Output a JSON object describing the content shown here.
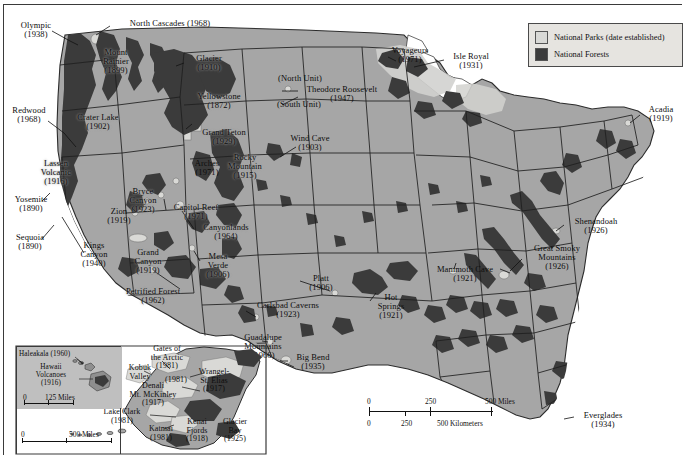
{
  "map": {
    "title": "United States National Parks and National Forests",
    "colors": {
      "land": "#a6a6a6",
      "park": "#d9d9d6",
      "forest": "#3b3b3b",
      "water": "#ffffff",
      "border": "#2b2b2b",
      "legend_bg": "#e6e4e0",
      "text": "#0d0d0d"
    }
  },
  "legend": {
    "items": [
      {
        "label": "National Parks (date established)",
        "swatch": "#d9d9d6",
        "name": "legend-national-parks"
      },
      {
        "label": "National Forests",
        "swatch": "#3b3b3b",
        "name": "legend-national-forests"
      }
    ]
  },
  "scale_main": {
    "miles_ticks": [
      "0",
      "250",
      "500 Miles"
    ],
    "km_ticks": [
      "0",
      "250",
      "500 Kilometers"
    ]
  },
  "scale_hawaii": {
    "ticks": [
      "0",
      "125 Miles"
    ]
  },
  "scale_alaska": {
    "ticks": [
      "0",
      "500 Miles"
    ]
  },
  "parks": [
    {
      "name": "olympic",
      "label": "Olympic\n(1938)",
      "x": 6,
      "y": 16,
      "w": 52
    },
    {
      "name": "north-cascades",
      "label": "North Cascades (1968)",
      "x": 108,
      "y": 14,
      "w": 116
    },
    {
      "name": "mount-rainier",
      "label": "Mount\nRainier\n(1899)",
      "x": 89,
      "y": 43,
      "w": 46
    },
    {
      "name": "glacier",
      "label": "Glacier\n(1910)",
      "x": 183,
      "y": 49,
      "w": 44
    },
    {
      "name": "yellowstone",
      "label": "Yellowstone\n(1872)",
      "x": 185,
      "y": 87,
      "w": 60
    },
    {
      "name": "grand-teton",
      "label": "Grand Teton\n(1929)",
      "x": 189,
      "y": 123,
      "w": 62
    },
    {
      "name": "north-unit",
      "label": "(North Unit)",
      "x": 268,
      "y": 69,
      "w": 56
    },
    {
      "name": "theodore-roosevelt",
      "label": "Theodore Roosevelt\n(1947)",
      "x": 294,
      "y": 80,
      "w": 88
    },
    {
      "name": "south-unit",
      "label": "(South Unit)",
      "x": 266,
      "y": 95,
      "w": 58
    },
    {
      "name": "voyageurs",
      "label": "Voyageurs\n(1971)",
      "x": 380,
      "y": 41,
      "w": 52
    },
    {
      "name": "isle-royal",
      "label": "Isle Royal\n(1931)",
      "x": 443,
      "y": 47,
      "w": 48
    },
    {
      "name": "acadia",
      "label": "Acadia\n(1919)",
      "x": 637,
      "y": 100,
      "w": 40
    },
    {
      "name": "redwood",
      "label": "Redwood\n(1968)",
      "x": 2,
      "y": 101,
      "w": 46
    },
    {
      "name": "crater-lake",
      "label": "Crater Lake\n(1902)",
      "x": 66,
      "y": 108,
      "w": 56
    },
    {
      "name": "wind-cave",
      "label": "Wind Cave\n(1903)",
      "x": 281,
      "y": 129,
      "w": 50
    },
    {
      "name": "lassen-volcanic",
      "label": "Lassen\nVolcanic\n(1916)",
      "x": 30,
      "y": 154,
      "w": 44
    },
    {
      "name": "arches",
      "label": "Arches\n(1971)",
      "x": 183,
      "y": 154,
      "w": 40
    },
    {
      "name": "rocky-mountain",
      "label": "Rocky\nMountain\n(1915)",
      "x": 218,
      "y": 148,
      "w": 46
    },
    {
      "name": "yosemite",
      "label": "Yosemite\n(1890)",
      "x": 5,
      "y": 190,
      "w": 44
    },
    {
      "name": "bryce-canyon",
      "label": "Bryce\nCanyon\n(1923)",
      "x": 119,
      "y": 182,
      "w": 40
    },
    {
      "name": "zion",
      "label": "Zion\n(1919)",
      "x": 98,
      "y": 202,
      "w": 34
    },
    {
      "name": "capitol-reef",
      "label": "Capitol Reef\n(1971)",
      "x": 163,
      "y": 198,
      "w": 58
    },
    {
      "name": "canyonlands",
      "label": "Canyonlands\n(1964)",
      "x": 191,
      "y": 218,
      "w": 62
    },
    {
      "name": "sequoia",
      "label": "Sequoia\n(1890)",
      "x": 4,
      "y": 228,
      "w": 44
    },
    {
      "name": "kings-canyon",
      "label": "Kings\nCanyon\n(1940)",
      "x": 69,
      "y": 236,
      "w": 42
    },
    {
      "name": "grand-canyon",
      "label": "Grand\nCanyon\n(1919)",
      "x": 122,
      "y": 243,
      "w": 44
    },
    {
      "name": "mesa-verde",
      "label": "Mesa\nVerde\n(1906)",
      "x": 194,
      "y": 247,
      "w": 40
    },
    {
      "name": "shenandoah",
      "label": "Shenandoah\n(1926)",
      "x": 563,
      "y": 212,
      "w": 58
    },
    {
      "name": "great-smoky",
      "label": "Great Smoky\nMountains\n(1926)",
      "x": 522,
      "y": 239,
      "w": 62
    },
    {
      "name": "mammoth-cave",
      "label": "Mammoth Cave\n(1921)",
      "x": 424,
      "y": 260,
      "w": 74
    },
    {
      "name": "petrified-forest",
      "label": "Petrified Forest\n(1962)",
      "x": 112,
      "y": 282,
      "w": 74
    },
    {
      "name": "platt",
      "label": "Platt\n(1906)",
      "x": 300,
      "y": 269,
      "w": 34
    },
    {
      "name": "hot-springs",
      "label": "Hot\nSprings\n(1921)",
      "x": 367,
      "y": 288,
      "w": 40
    },
    {
      "name": "carlsbad-caverns",
      "label": "Carlsbad Caverns\n(1923)",
      "x": 243,
      "y": 296,
      "w": 82
    },
    {
      "name": "guadalupe-mountains",
      "label": "Guadalupe\nMountains\n(1966)",
      "x": 231,
      "y": 328,
      "w": 56
    },
    {
      "name": "big-bend",
      "label": "Big Bend\n(1935)",
      "x": 285,
      "y": 348,
      "w": 48
    },
    {
      "name": "everglades",
      "label": "Everglades\n(1934)",
      "x": 572,
      "y": 406,
      "w": 54
    }
  ],
  "alaska_parks": [
    {
      "name": "gates-of-the-arctic",
      "label": "Gates of\nthe Arctic\n(1981)",
      "x": 140,
      "y": 340,
      "w": 46
    },
    {
      "name": "kobuk-valley",
      "label": "Kobuk\nValley",
      "x": 118,
      "y": 359,
      "w": 36
    },
    {
      "name": "kobuk-valley-date",
      "label": "(1981)",
      "x": 156,
      "y": 371,
      "w": 32
    },
    {
      "name": "wrangell-st-elias",
      "label": "Wrangel-\nSt. Elias\n(1917)",
      "x": 188,
      "y": 363,
      "w": 44
    },
    {
      "name": "denali",
      "label": "Denali\nMt. McKinley\n(1917)",
      "x": 116,
      "y": 377,
      "w": 66
    },
    {
      "name": "lake-clark",
      "label": "Lake Clark\n(1981)",
      "x": 91,
      "y": 403,
      "w": 54
    },
    {
      "name": "katmai",
      "label": "Katmai\n(1981)",
      "x": 137,
      "y": 420,
      "w": 40
    },
    {
      "name": "kenai-fjords",
      "label": "Kenai\nFjords\n(1918)",
      "x": 174,
      "y": 413,
      "w": 38
    },
    {
      "name": "glacier-bay",
      "label": "Glacier\nBay\n(1925)",
      "x": 212,
      "y": 413,
      "w": 38
    }
  ],
  "hawaii_parks": [
    {
      "name": "haleakala",
      "label": "Haleakala (1960)",
      "x": 14,
      "y": 344,
      "w": 72
    },
    {
      "name": "hawaii-volcanoes",
      "label": "Hawaii\nVolcanoes\n(1916)",
      "x": 20,
      "y": 357,
      "w": 52
    }
  ]
}
